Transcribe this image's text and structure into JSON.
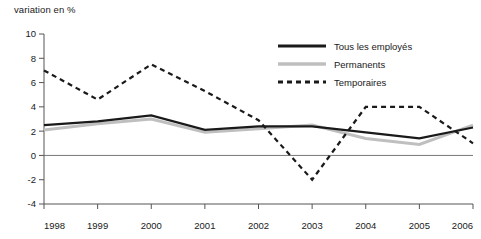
{
  "chart_data": {
    "type": "line",
    "title": "variation en %",
    "xlabel": "",
    "ylabel": "variation en %",
    "x": [
      1998,
      1999,
      2000,
      2001,
      2002,
      2003,
      2004,
      2005,
      2006
    ],
    "categories": [
      "1998",
      "1999",
      "2000",
      "2001",
      "2002",
      "2003",
      "2004",
      "2005",
      "2006"
    ],
    "xlim": [
      1998,
      2006
    ],
    "ylim": [
      -4,
      10
    ],
    "yticks": [
      -4,
      -2,
      0,
      2,
      4,
      6,
      8,
      10
    ],
    "ytick_labels": [
      "-4",
      "-2",
      "0",
      "2",
      "4",
      "6",
      "8",
      "10"
    ],
    "grid": false,
    "zero_line": true,
    "legend_position": "top-center",
    "series": [
      {
        "name": "Tous les employés",
        "style": "solid",
        "color": "#1a1a1a",
        "width": 2.2,
        "values": [
          2.5,
          2.8,
          3.3,
          2.1,
          2.4,
          2.4,
          1.9,
          1.4,
          2.3
        ]
      },
      {
        "name": "Permanents",
        "style": "solid",
        "color": "#bfbfbf",
        "width": 3.0,
        "values": [
          2.1,
          2.6,
          3.0,
          1.9,
          2.2,
          2.5,
          1.4,
          0.9,
          2.5
        ]
      },
      {
        "name": "Temporaires",
        "style": "dashed",
        "color": "#1a1a1a",
        "width": 2.2,
        "values": [
          7.0,
          4.6,
          7.5,
          5.3,
          2.9,
          -2.0,
          4.0,
          4.0,
          1.0
        ]
      }
    ]
  },
  "legend": {
    "items": [
      {
        "label": "Tous les employés"
      },
      {
        "label": "Permanents"
      },
      {
        "label": "Temporaires"
      }
    ]
  },
  "colors": {
    "all_employees": "#1a1a1a",
    "permanent": "#bfbfbf",
    "temporary": "#1a1a1a",
    "axis": "#555555",
    "zero_line": "#777777",
    "background": "#ffffff"
  }
}
